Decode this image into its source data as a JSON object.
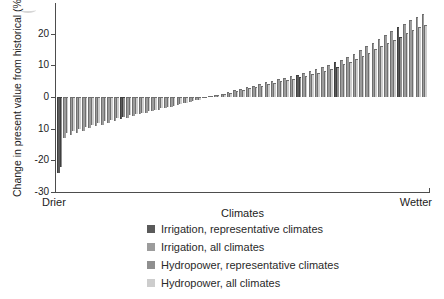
{
  "figure": {
    "y_axis_title": "Change in present value from historical (%)",
    "x_axis_title": "Climates",
    "x_left_end_label": "Drier",
    "x_right_end_label": "Wetter"
  },
  "chart_data": {
    "type": "bar",
    "title": "",
    "xlabel": "Climates",
    "ylabel": "Change in present value from historical (%)",
    "x_axis_endpoints": [
      "Drier",
      "Wetter"
    ],
    "x_sort_order": "climates sorted ascending from drier to wetter",
    "ylim": [
      -30,
      27
    ],
    "ytick_values": [
      20,
      10,
      0,
      -10,
      -20,
      -30
    ],
    "ytick_labels": [
      "20",
      "10",
      "0",
      "10",
      "-20",
      "-30"
    ],
    "grid": false,
    "n_climates": 59,
    "legend_position": "below chart, left-indented",
    "legend": [
      {
        "label": "Irrigation, representative climates",
        "color": "#5a5a5a"
      },
      {
        "label": "Irrigation, all climates",
        "color": "#9c9c9c"
      },
      {
        "label": "Hydropower, representative climates",
        "color": "#8f8f8f"
      },
      {
        "label": "Hydropower, all climates",
        "color": "#cdcdcd"
      }
    ],
    "colors": {
      "irrigation_representative": "#5a5a5a",
      "irrigation_all": "#9c9c9c",
      "hydropower_representative": "#8f8f8f",
      "hydropower_all": "#cdcdcd",
      "bar_edge": "#6f6f6f",
      "bar_edge_representative": "#3f3f3f",
      "axis": "#4d4d4d"
    },
    "representative_indices": [
      0,
      10,
      38,
      44,
      54
    ],
    "series": [
      {
        "name": "Irrigation",
        "values": [
          -24,
          -13,
          -12.1,
          -11.3,
          -10.6,
          -9.9,
          -9.3,
          -8.7,
          -8.1,
          -7.5,
          -7,
          -6.5,
          -6,
          -5.5,
          -5,
          -4.5,
          -4,
          -3.5,
          -3,
          -2.5,
          -2,
          -1.5,
          -1,
          -0.4,
          0.3,
          0.7,
          1.1,
          1.6,
          2.1,
          2.6,
          3.1,
          3.6,
          4.1,
          4.6,
          5.1,
          5.6,
          6.1,
          6.6,
          7.1,
          7.7,
          8.3,
          8.9,
          9.5,
          10.2,
          11,
          11.8,
          12.7,
          13.7,
          14.8,
          16,
          17.2,
          18.4,
          19.6,
          20.8,
          22,
          23.2,
          24.3,
          25.3,
          26.2
        ]
      },
      {
        "name": "Hydropower",
        "values": [
          -22,
          -11.5,
          -10.8,
          -10.1,
          -9.4,
          -8.8,
          -8.3,
          -7.7,
          -7.2,
          -6.7,
          -6.2,
          -5.8,
          -5.3,
          -4.9,
          -4.4,
          -4,
          -3.5,
          -3.1,
          -2.7,
          -2.2,
          -1.8,
          -1.3,
          -0.9,
          -0.3,
          0.3,
          0.6,
          1,
          1.4,
          1.8,
          2.3,
          2.7,
          3.1,
          3.6,
          4,
          4.4,
          4.9,
          5.3,
          5.7,
          6.2,
          6.7,
          7.2,
          7.7,
          8.3,
          8.9,
          9.6,
          10.3,
          11,
          11.9,
          12.9,
          13.9,
          15,
          16,
          17.1,
          18.1,
          19.1,
          20.2,
          21.1,
          22,
          22.8
        ]
      }
    ]
  }
}
